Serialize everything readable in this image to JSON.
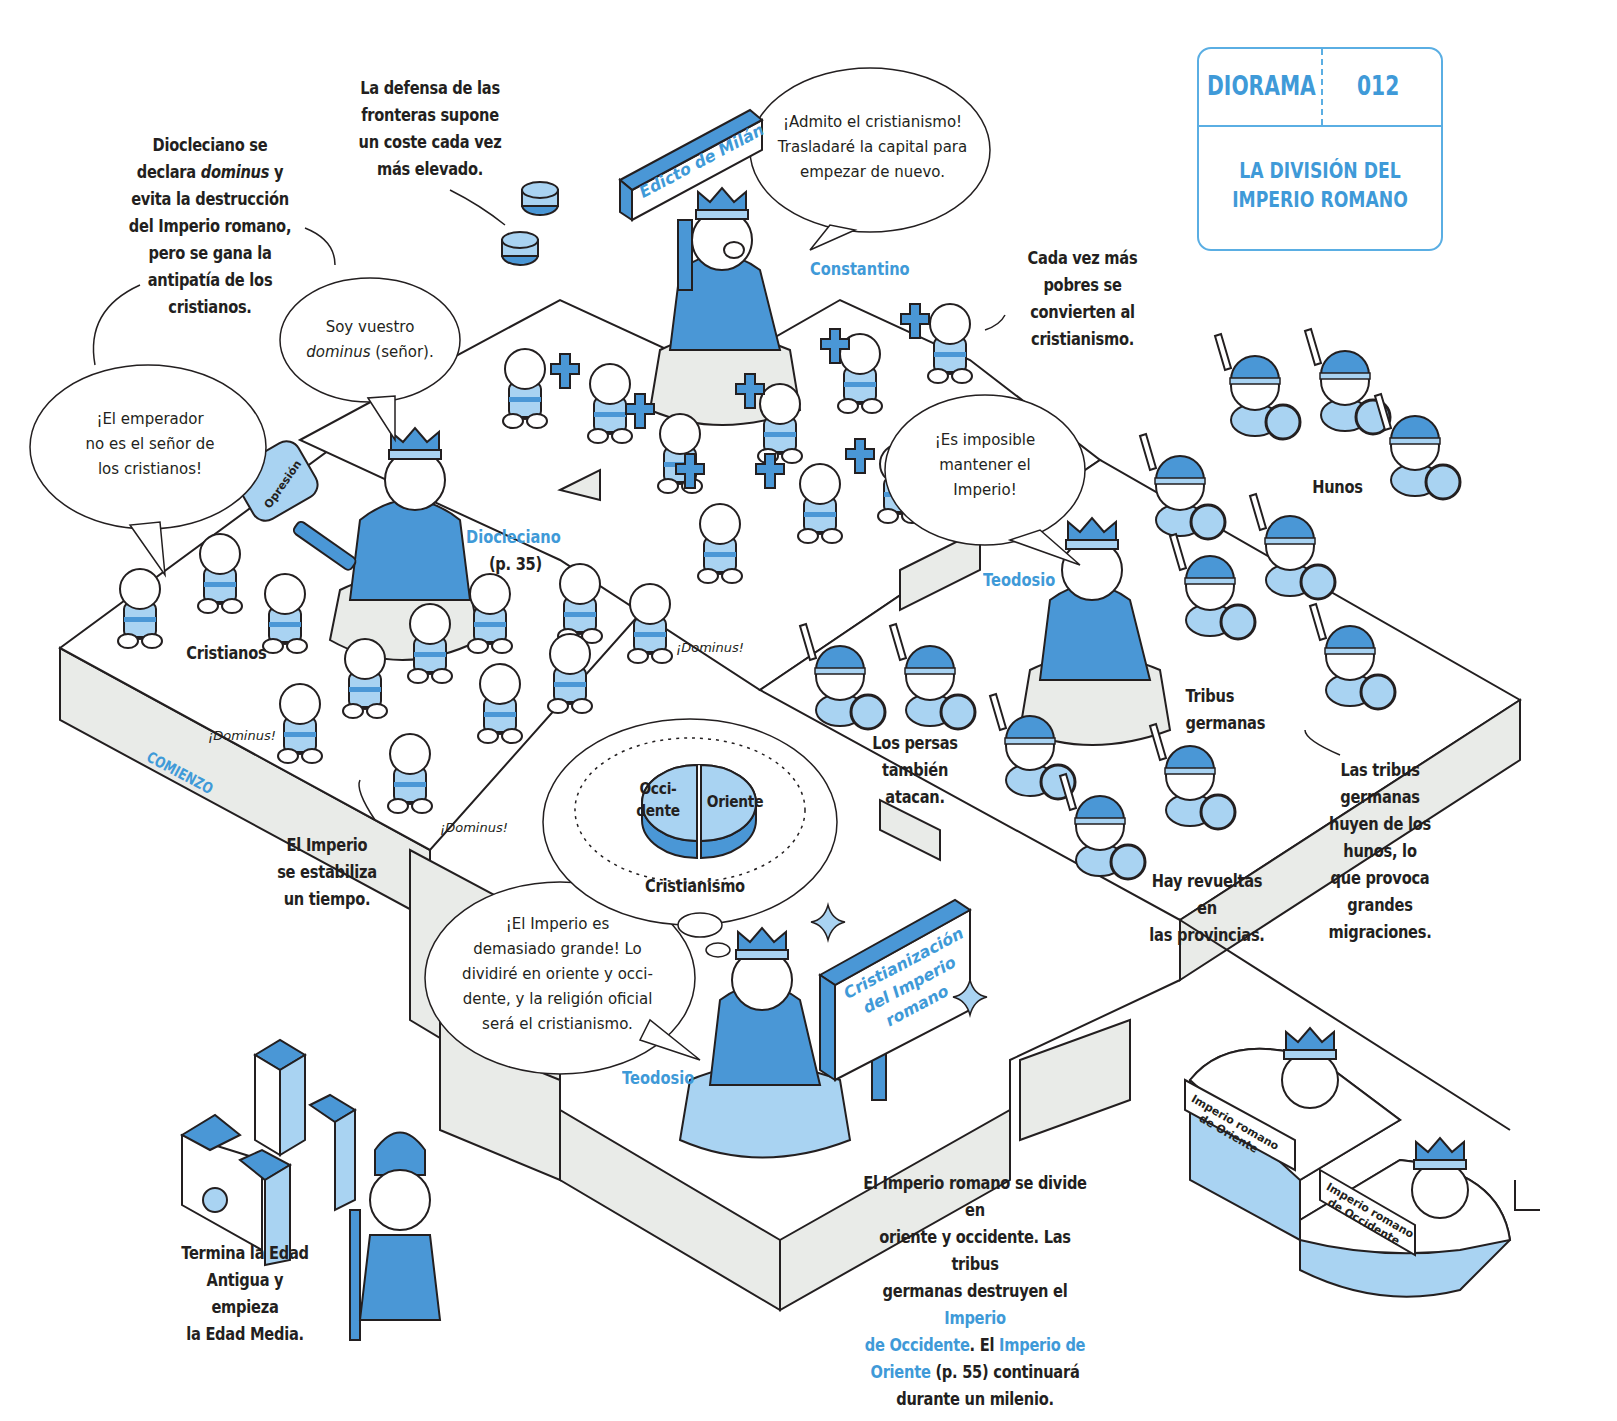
{
  "card": {
    "kicker": "DIORAMA",
    "number": "012",
    "title_line1": "LA DIVISIÓN DEL",
    "title_line2": "IMPERIO ROMANO"
  },
  "colors": {
    "accent_blue": "#3f9ad8",
    "mid_blue": "#4a97d6",
    "light_blue": "#a9d3f2",
    "platform_grey": "#e9ebe8",
    "ink": "#231f20"
  },
  "notes": {
    "diocleciano_intro": {
      "lines": [
        "Diocleciano se",
        "declara",
        "dominus",
        "y",
        "evita la destrucción",
        "del Imperio romano,",
        "pero se gana la",
        "antipatía de los",
        "cristianos."
      ]
    },
    "defensa": {
      "lines": [
        "La defensa de las",
        "fronteras supone",
        "un coste cada vez",
        "más elevado."
      ]
    },
    "pobres": {
      "lines": [
        "Cada vez más",
        "pobres se",
        "convierten al",
        "cristianismo."
      ]
    },
    "estabiliza": {
      "lines": [
        "El Imperio",
        "se estabiliza",
        "un tiempo."
      ]
    },
    "persas": {
      "lines": [
        "Los persas",
        "también atacan."
      ]
    },
    "revueltas": {
      "lines": [
        "Hay revueltas en",
        "las provincias."
      ]
    },
    "migraciones": {
      "lines": [
        "Las tribus",
        "germanas",
        "huyen de los",
        "hunos, lo",
        "que provoca",
        "grandes",
        "migraciones."
      ]
    },
    "edad_media": {
      "lines": [
        "Termina la Edad",
        "Antigua y empieza",
        "la Edad Media."
      ]
    },
    "division": {
      "line1": "El Imperio romano se divide en",
      "line2": "oriente y occidente. Las tribus",
      "line3_a": "germanas destruyen el ",
      "line3_b": "Imperio",
      "line4_a": "de Occidente",
      "line4_b": ". El ",
      "line4_c": "Imperio de",
      "line5_a": "Oriente",
      "line5_b": " (p. 55) continuará",
      "line6": "durante un milenio."
    }
  },
  "speech": {
    "cristianos": [
      "¡El emperador",
      "no es el señor de",
      "los cristianos!"
    ],
    "diocleciano_a": "Soy vuestro",
    "diocleciano_b_em": "dominus",
    "diocleciano_b": " (señor).",
    "constantino": [
      "¡Admito el cristianismo!",
      "Trasladaré la capital para",
      "empezar de nuevo."
    ],
    "teodosio_top": [
      "¡Es imposible",
      "mantener el",
      "Imperio!"
    ],
    "teodosio_bottom": [
      "¡El Imperio es",
      "demasiado grande! Lo",
      "dividiré en oriente y occi-",
      "dente, y la religión oficial",
      "será el cristianismo."
    ],
    "shouts": [
      "¡Dominus!",
      "¡Dominus!",
      "¡Dominus!"
    ]
  },
  "labels": {
    "diocleciano": "Diocleciano",
    "diocleciano_ref": "(p. 35)",
    "constantino": "Constantino",
    "teodosio_top": "Teodosio",
    "teodosio_bottom": "Teodosio",
    "cristianos": "Cristianos",
    "hunos": "Hunos",
    "tribus_germanas": "Tribus germanas",
    "comienzo": "COMIENZO",
    "opresion": "Opresión",
    "cristianismo": "Cristianismo",
    "occidente": [
      "Occi-",
      "dente"
    ],
    "oriente": "Oriente"
  },
  "signs": {
    "edicto": "Edicto de Milán",
    "cristianizacion": [
      "Cristianización",
      "del Imperio",
      "romano"
    ],
    "oriente_sign": [
      "Imperio romano",
      "de Oriente"
    ],
    "occidente_sign": [
      "Imperio romano",
      "de Occidente"
    ]
  }
}
